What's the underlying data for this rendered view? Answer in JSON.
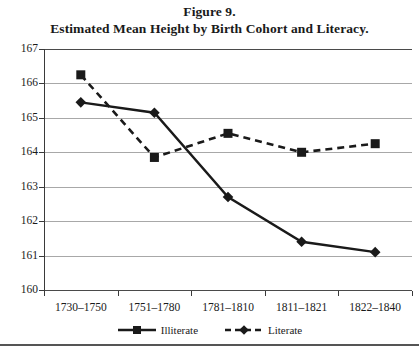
{
  "title": {
    "line1": "Figure 9.",
    "line2": "Estimated Mean Height by Birth Cohort and Literacy."
  },
  "legend": {
    "items": [
      {
        "label": "Illiterate",
        "marker": "square-marker",
        "line_style": "solid",
        "color": "#1a1a1a"
      },
      {
        "label": "Literate",
        "marker": "diamond-marker",
        "line_style": "dashed",
        "color": "#1a1a1a"
      }
    ]
  },
  "chart_data": {
    "type": "line",
    "title": "Estimated Mean Height by Birth Cohort and Literacy.",
    "xlabel": "",
    "ylabel": "",
    "categories": [
      "1730–1750",
      "1751–1780",
      "1781–1810",
      "1811–1821",
      "1822–1840"
    ],
    "series": [
      {
        "name": "Illiterate",
        "values": [
          165.45,
          165.15,
          162.7,
          161.4,
          161.1
        ]
      },
      {
        "name": "Literate",
        "values": [
          166.25,
          163.85,
          164.55,
          164.0,
          164.25
        ]
      }
    ],
    "ylim": [
      160,
      167
    ],
    "yticks": [
      160,
      161,
      162,
      163,
      164,
      165,
      166,
      167
    ],
    "ytick_labels": [
      "160",
      "161",
      "162",
      "163",
      "164",
      "165",
      "166",
      "167"
    ],
    "grid": true,
    "legend_position": "bottom"
  }
}
